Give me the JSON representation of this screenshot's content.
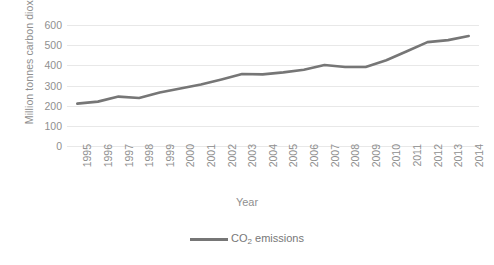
{
  "chart_data": {
    "type": "line",
    "title": "",
    "xlabel": "Year",
    "ylabel": "Million tonnes carbon dioxide",
    "ylim": [
      0,
      600
    ],
    "ytick_labels": [
      "600",
      "500",
      "400",
      "300",
      "200",
      "100",
      "0"
    ],
    "yticks": [
      600,
      500,
      400,
      300,
      200,
      100,
      0
    ],
    "grid": true,
    "legend_position": "bottom",
    "categories": [
      "1995",
      "1996",
      "1997",
      "1998",
      "1999",
      "2000",
      "2001",
      "2002",
      "2003",
      "2004",
      "2005",
      "2006",
      "2007",
      "2008",
      "2009",
      "2010",
      "2011",
      "2012",
      "2013",
      "2014"
    ],
    "series": [
      {
        "name": "CO2 emissions",
        "name_display_prefix": "CO",
        "name_display_sub": "2",
        "name_display_suffix": " emissions",
        "color": "#767676",
        "values": [
          210,
          220,
          245,
          238,
          265,
          285,
          305,
          330,
          357,
          355,
          365,
          378,
          402,
          392,
          392,
          425,
          470,
          515,
          525,
          545
        ]
      }
    ]
  },
  "axis": {
    "x_title": "Year",
    "y_title": "Million tonnes carbon dioxide"
  },
  "legend": {
    "prefix": "CO",
    "sub": "2",
    "suffix": " emissions"
  }
}
